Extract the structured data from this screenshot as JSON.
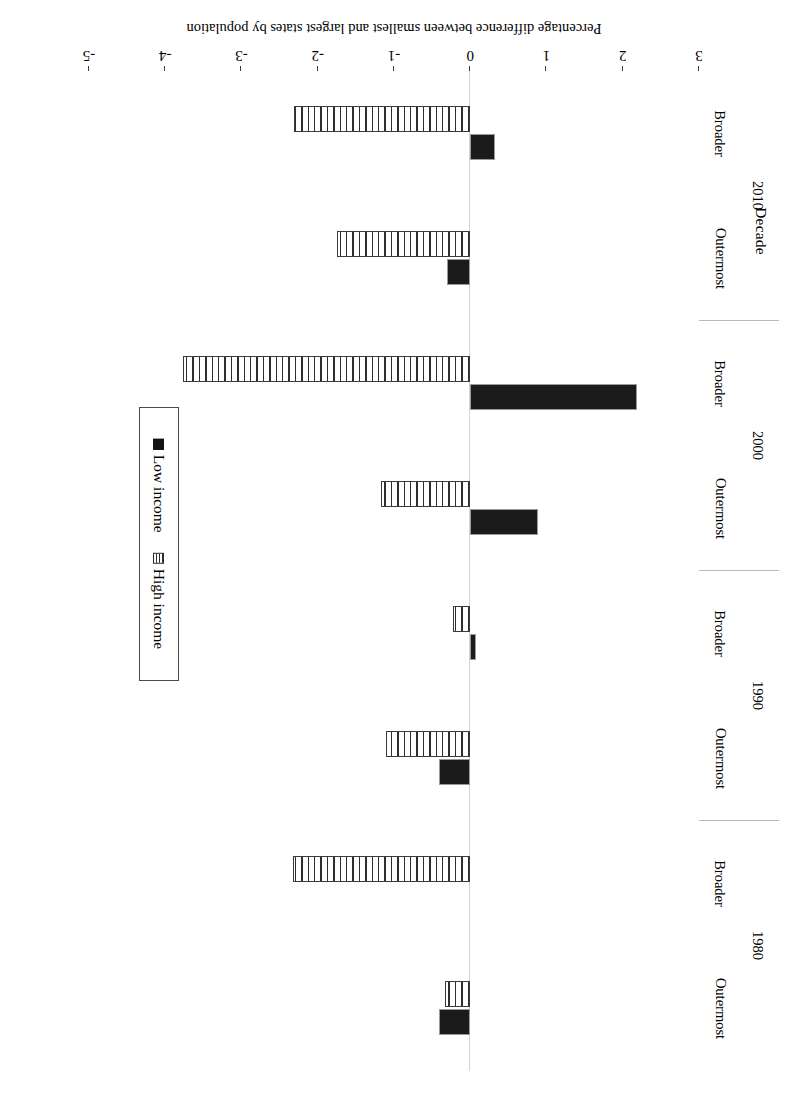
{
  "chart_data": {
    "type": "bar",
    "title": "",
    "orientation": "horizontal",
    "rotation_degrees": 180,
    "xlabel": "Decade",
    "ylabel": "Percentage difference between smallest and largest states by population",
    "value_axis_label": "Percentage difference between smallest and largest states by population",
    "category_axis_label": "Decade",
    "ylim": [
      -5,
      3
    ],
    "value_ticks": [
      3,
      2,
      1,
      0,
      -1,
      -2,
      -3,
      -4,
      -5
    ],
    "value_tick_labels": [
      "3",
      "2",
      "1",
      "0",
      "-1",
      "-2",
      "-3",
      "-4",
      "-5"
    ],
    "grid": false,
    "legend_position": "right",
    "decades": [
      "1980",
      "1990",
      "2000",
      "2010"
    ],
    "subcategories": [
      "Outermost",
      "Broader"
    ],
    "categories": [
      "1980 Outermost",
      "1980 Broader",
      "1990 Outermost",
      "1990 Broader",
      "2000 Outermost",
      "2000 Broader",
      "2010 Outermost",
      "2010 Broader"
    ],
    "series": [
      {
        "name": "Low income",
        "color": "#1b1b1b",
        "pattern": "solid",
        "values": [
          -0.41,
          0.0,
          -0.41,
          0.08,
          0.89,
          2.19,
          -0.31,
          0.32
        ]
      },
      {
        "name": "High income",
        "color": "#ffffff",
        "pattern": "vertical-hatch",
        "values": [
          -0.33,
          -2.33,
          -1.11,
          -0.22,
          -1.17,
          -3.77,
          -1.75,
          -2.31
        ]
      }
    ]
  },
  "legend": {
    "items": [
      {
        "label": "Low income",
        "swatch": "solid-black-square"
      },
      {
        "label": "High income",
        "swatch": "hatched-square"
      }
    ]
  },
  "colors": {
    "low_income": "#1b1b1b",
    "high_income_outline": "#2e2e2e",
    "axis": "#3a3a3a",
    "zero_line": "#d4d4d4",
    "separator": "#b9b9b9",
    "background": "#ffffff"
  }
}
